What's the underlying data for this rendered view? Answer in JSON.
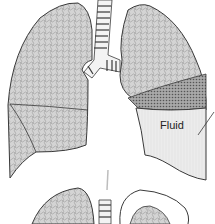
{
  "diagram": {
    "labels": {
      "fluid": "Fluid"
    },
    "colors": {
      "lung_fill": "#cfcfcf",
      "lung_stroke": "#3a3a3a",
      "dense_tissue": "#9a9a9a",
      "fluid_fill": "#ececec",
      "arrow": "#bdbdbd",
      "background": "#ffffff"
    },
    "panels": [
      {
        "name": "top",
        "description": "lungs with fluid collected in lower left (viewer's right) pleural space"
      },
      {
        "name": "bottom",
        "description": "lungs partially shown, cropped at bottom edge"
      }
    ]
  }
}
